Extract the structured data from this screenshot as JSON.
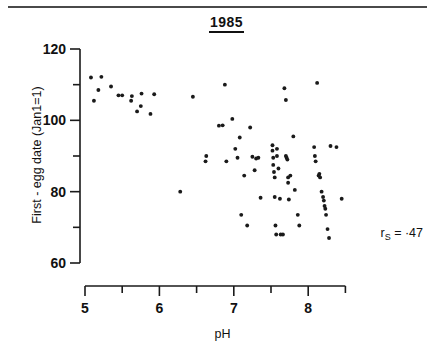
{
  "figure": {
    "title": "1985",
    "x_axis_title": "pH",
    "y_axis_title": "First - egg date (Jan1=1)",
    "annotation": {
      "symbol": "r",
      "subscript": "S",
      "equals": "=",
      "value": "·47",
      "full": "rS = ·47"
    },
    "ink_color": "#1a1a1a",
    "background_color": "#ffffff"
  },
  "chart_data": {
    "type": "scatter",
    "title": "1985",
    "xlabel": "pH",
    "ylabel": "First - egg date (Jan1=1)",
    "xlim": [
      4.75,
      8.65
    ],
    "ylim": [
      58,
      122
    ],
    "xticks": [
      5,
      5.5,
      6,
      6.5,
      7,
      7.5,
      8,
      8.5
    ],
    "xticklabels": [
      "5",
      "",
      "6",
      "",
      "7",
      "",
      "8",
      ""
    ],
    "yticks": [
      60,
      70,
      80,
      90,
      100,
      110,
      120
    ],
    "yticklabels": [
      "60",
      "",
      "80",
      "",
      "100",
      "",
      "120"
    ],
    "grid": false,
    "legend": null,
    "annotations": [
      {
        "text": "rS = ·47",
        "x": 8.3,
        "y": 68,
        "meaning": "Spearman rank correlation = -0.47"
      }
    ],
    "marker": {
      "shape": "circle",
      "size": 3.0,
      "color": "#1a1a1a"
    },
    "points": [
      [
        5.08,
        112.0
      ],
      [
        5.12,
        105.5
      ],
      [
        5.18,
        108.5
      ],
      [
        5.22,
        112.2
      ],
      [
        5.35,
        109.5
      ],
      [
        5.45,
        107.0
      ],
      [
        5.5,
        107.0
      ],
      [
        5.62,
        105.5
      ],
      [
        5.63,
        106.8
      ],
      [
        5.7,
        102.5
      ],
      [
        5.75,
        104.0
      ],
      [
        5.76,
        107.5
      ],
      [
        5.88,
        101.8
      ],
      [
        5.93,
        107.3
      ],
      [
        6.28,
        80.0
      ],
      [
        6.45,
        106.6
      ],
      [
        6.62,
        88.5
      ],
      [
        6.63,
        90.0
      ],
      [
        6.8,
        98.5
      ],
      [
        6.85,
        98.6
      ],
      [
        6.88,
        110.0
      ],
      [
        6.9,
        88.5
      ],
      [
        6.98,
        100.4
      ],
      [
        7.02,
        92.0
      ],
      [
        7.05,
        89.5
      ],
      [
        7.08,
        95.2
      ],
      [
        7.1,
        73.5
      ],
      [
        7.14,
        84.5
      ],
      [
        7.18,
        70.5
      ],
      [
        7.22,
        98.0
      ],
      [
        7.25,
        89.8
      ],
      [
        7.28,
        86.0
      ],
      [
        7.3,
        89.3
      ],
      [
        7.33,
        89.5
      ],
      [
        7.36,
        78.3
      ],
      [
        7.52,
        93.0
      ],
      [
        7.52,
        91.5
      ],
      [
        7.53,
        89.5
      ],
      [
        7.53,
        87.5
      ],
      [
        7.54,
        85.5
      ],
      [
        7.55,
        84.0
      ],
      [
        7.55,
        78.5
      ],
      [
        7.56,
        70.5
      ],
      [
        7.57,
        68.0
      ],
      [
        7.58,
        92.0
      ],
      [
        7.58,
        90.0
      ],
      [
        7.6,
        86.5
      ],
      [
        7.62,
        78.0
      ],
      [
        7.63,
        68.0
      ],
      [
        7.66,
        68.0
      ],
      [
        7.68,
        109.0
      ],
      [
        7.7,
        105.7
      ],
      [
        7.7,
        90.0
      ],
      [
        7.71,
        89.5
      ],
      [
        7.72,
        89.0
      ],
      [
        7.73,
        84.0
      ],
      [
        7.73,
        82.5
      ],
      [
        7.74,
        77.8
      ],
      [
        7.76,
        84.5
      ],
      [
        7.8,
        95.5
      ],
      [
        7.82,
        80.5
      ],
      [
        7.86,
        73.5
      ],
      [
        7.88,
        70.5
      ],
      [
        8.08,
        92.5
      ],
      [
        8.09,
        90.0
      ],
      [
        8.1,
        88.5
      ],
      [
        8.12,
        110.5
      ],
      [
        8.14,
        84.5
      ],
      [
        8.15,
        85.0
      ],
      [
        8.16,
        84.0
      ],
      [
        8.18,
        80.0
      ],
      [
        8.2,
        78.5
      ],
      [
        8.21,
        77.5
      ],
      [
        8.22,
        76.0
      ],
      [
        8.23,
        75.2
      ],
      [
        8.24,
        73.5
      ],
      [
        8.26,
        69.5
      ],
      [
        8.28,
        67.0
      ],
      [
        8.3,
        92.8
      ],
      [
        8.38,
        92.5
      ],
      [
        8.45,
        78.0
      ]
    ]
  }
}
